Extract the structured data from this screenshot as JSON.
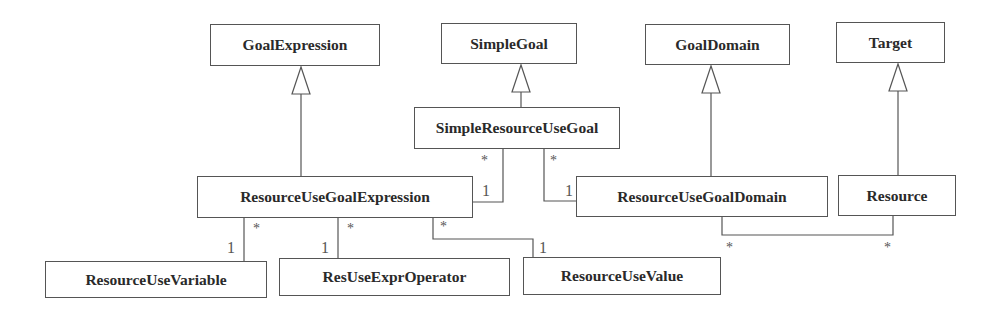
{
  "diagram": {
    "type": "UML class diagram",
    "classes": [
      {
        "id": "goal_expression",
        "name": "GoalExpression",
        "x": 210,
        "y": 24,
        "w": 170,
        "h": 42
      },
      {
        "id": "simple_goal",
        "name": "SimpleGoal",
        "x": 441,
        "y": 23,
        "w": 136,
        "h": 41
      },
      {
        "id": "goal_domain",
        "name": "GoalDomain",
        "x": 645,
        "y": 24,
        "w": 145,
        "h": 41
      },
      {
        "id": "target",
        "name": "Target",
        "x": 836,
        "y": 22,
        "w": 109,
        "h": 41
      },
      {
        "id": "simple_resource_use_goal",
        "name": "SimpleResourceUseGoal",
        "x": 414,
        "y": 107,
        "w": 206,
        "h": 42
      },
      {
        "id": "resource_use_goal_expression",
        "name": "ResourceUseGoalExpression",
        "x": 197,
        "y": 176,
        "w": 276,
        "h": 42
      },
      {
        "id": "resource_use_goal_domain",
        "name": "ResourceUseGoalDomain",
        "x": 576,
        "y": 176,
        "w": 252,
        "h": 41
      },
      {
        "id": "resource",
        "name": "Resource",
        "x": 838,
        "y": 175,
        "w": 118,
        "h": 41
      },
      {
        "id": "resource_use_variable",
        "name": "ResourceUseVariable",
        "x": 45,
        "y": 261,
        "w": 222,
        "h": 37
      },
      {
        "id": "res_use_expr_operator",
        "name": "ResUseExprOperator",
        "x": 279,
        "y": 258,
        "w": 231,
        "h": 38
      },
      {
        "id": "resource_use_value",
        "name": "ResourceUseValue",
        "x": 523,
        "y": 257,
        "w": 198,
        "h": 38
      }
    ],
    "generalizations": [
      {
        "child": "ResourceUseGoalExpression",
        "parent": "GoalExpression"
      },
      {
        "child": "SimpleResourceUseGoal",
        "parent": "SimpleGoal"
      },
      {
        "child": "ResourceUseGoalDomain",
        "parent": "GoalDomain"
      },
      {
        "child": "Resource",
        "parent": "Target"
      }
    ],
    "associations": [
      {
        "from": "SimpleResourceUseGoal",
        "from_mult": "*",
        "to": "ResourceUseGoalExpression",
        "to_mult": "1"
      },
      {
        "from": "SimpleResourceUseGoal",
        "from_mult": "*",
        "to": "ResourceUseGoalDomain",
        "to_mult": "1"
      },
      {
        "from": "ResourceUseGoalExpression",
        "from_mult": "*",
        "to": "ResourceUseVariable",
        "to_mult": "1"
      },
      {
        "from": "ResourceUseGoalExpression",
        "from_mult": "*",
        "to": "ResUseExprOperator",
        "to_mult": "1"
      },
      {
        "from": "ResourceUseGoalExpression",
        "from_mult": "*",
        "to": "ResourceUseValue",
        "to_mult": "1"
      },
      {
        "from": "ResourceUseGoalDomain",
        "from_mult": "*",
        "to": "Resource",
        "to_mult": "*"
      }
    ],
    "multiplicity_labels": [
      {
        "text": "*",
        "x": 481,
        "y": 154
      },
      {
        "text": "*",
        "x": 550,
        "y": 154
      },
      {
        "text": "1",
        "x": 482,
        "y": 183
      },
      {
        "text": "1",
        "x": 565,
        "y": 183
      },
      {
        "text": "*",
        "x": 253,
        "y": 222
      },
      {
        "text": "1",
        "x": 227,
        "y": 240
      },
      {
        "text": "*",
        "x": 347,
        "y": 222
      },
      {
        "text": "1",
        "x": 321,
        "y": 240
      },
      {
        "text": "*",
        "x": 440,
        "y": 220
      },
      {
        "text": "1",
        "x": 539,
        "y": 240
      },
      {
        "text": "*",
        "x": 726,
        "y": 241
      },
      {
        "text": "*",
        "x": 884,
        "y": 241
      }
    ]
  }
}
